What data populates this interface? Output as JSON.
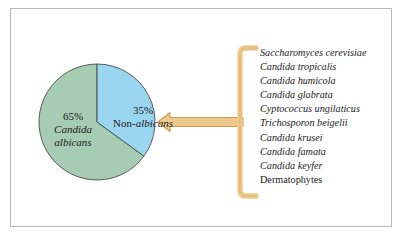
{
  "figure": {
    "frame_color": "#b9b9b9",
    "background": "#ffffff"
  },
  "chart_data": {
    "type": "pie",
    "title": "",
    "categories": [
      "Candida albicans",
      "Non-albicans"
    ],
    "values": [
      65,
      35
    ],
    "labels": [
      "65%",
      "35%"
    ],
    "colors": [
      "#a7ccb4",
      "#9bd6f0"
    ],
    "start_angle_deg": 0,
    "direction": "clockwise",
    "outline_color": "#4a4a4a",
    "legend": "none",
    "annotations": [
      "Arrow from species list points to the Non-albicans slice"
    ]
  },
  "pie": {
    "slices": [
      {
        "name": "albicans-slice",
        "percent_label": "65%",
        "name_line1": "Candida",
        "name_line2": "albicans",
        "color": "#a7ccb4"
      },
      {
        "name": "non-albicans-slice",
        "percent_label": "35%",
        "prefix": "Non-",
        "italic_part": "albicans",
        "color": "#9bd6f0"
      }
    ]
  },
  "connector": {
    "arrow_color": "#edc98c",
    "arrow_outline": "#c89b4e",
    "bracket_color": "#edc98c",
    "bracket_outline": "#c89b4e",
    "direction": "left"
  },
  "species_list": {
    "items": [
      {
        "text": "Saccharomyces cerevisiae",
        "italic": true
      },
      {
        "text": "Candida tropicalis",
        "italic": true
      },
      {
        "text": "Candida humicola",
        "italic": true
      },
      {
        "text": "Candida glabrata",
        "italic": true
      },
      {
        "text": "Cyptococcus ungilaticus",
        "italic": true
      },
      {
        "text": "Trichosporon beigelii",
        "italic": true
      },
      {
        "text": "Candida krusei",
        "italic": true
      },
      {
        "text": "Candida famata",
        "italic": true
      },
      {
        "text": "Candida keyfer",
        "italic": true
      },
      {
        "text": "Dermatophytes",
        "italic": false
      }
    ]
  }
}
